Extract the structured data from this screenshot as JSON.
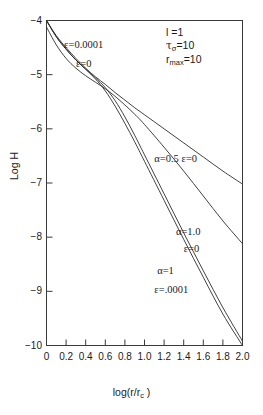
{
  "chart_data": {
    "type": "line",
    "title": "",
    "xlabel": "log(r/r_c )",
    "ylabel": "Log H",
    "xlim": [
      0,
      2.0
    ],
    "ylim": [
      -10,
      -4
    ],
    "grid": false,
    "legend": "inline-annotations",
    "xticks": [
      "0",
      "0.2",
      "0.4",
      "0.6",
      "0.8",
      "1.0",
      "1.2",
      "1.4",
      "1.6",
      "1.8",
      "2.0"
    ],
    "xtick_values": [
      0,
      0.2,
      0.4,
      0.6,
      0.8,
      1.0,
      1.2,
      1.4,
      1.6,
      1.8,
      2.0
    ],
    "yticks": [
      "-4",
      "-5",
      "-6",
      "-7",
      "-8",
      "-9",
      "-10"
    ],
    "ytick_values": [
      -4,
      -5,
      -6,
      -7,
      -8,
      -9,
      -10
    ],
    "series": [
      {
        "name": "alpha=0.5 epsilon=0.0001",
        "label": "ε=0.0001",
        "x": [
          0.0,
          0.1,
          0.2,
          0.3,
          0.4,
          0.5,
          0.6,
          0.7,
          0.8,
          0.9,
          1.0,
          1.2,
          1.4,
          1.6,
          1.8,
          2.0
        ],
        "y": [
          -4.0,
          -4.28,
          -4.5,
          -4.7,
          -4.88,
          -5.04,
          -5.18,
          -5.33,
          -5.47,
          -5.61,
          -5.74,
          -6.0,
          -6.26,
          -6.52,
          -6.78,
          -7.02
        ]
      },
      {
        "name": "alpha=0.5 epsilon=0",
        "label": "ε=0",
        "x": [
          0.0,
          0.1,
          0.2,
          0.3,
          0.4,
          0.5,
          0.6,
          0.7,
          0.8,
          0.9,
          1.0,
          1.2,
          1.4,
          1.6,
          1.8,
          2.0
        ],
        "y": [
          -4.12,
          -4.45,
          -4.7,
          -4.88,
          -5.02,
          -5.14,
          -5.26,
          -5.4,
          -5.56,
          -5.73,
          -5.92,
          -6.34,
          -6.78,
          -7.24,
          -7.7,
          -8.12
        ]
      },
      {
        "name": "alpha=1.0 epsilon=0",
        "label": "α=1.0 ε=0",
        "x": [
          0.0,
          0.1,
          0.2,
          0.3,
          0.4,
          0.5,
          0.6,
          0.7,
          0.8,
          0.9,
          1.0,
          1.2,
          1.4,
          1.6,
          1.8,
          2.0
        ],
        "y": [
          -4.0,
          -4.3,
          -4.53,
          -4.73,
          -4.9,
          -5.06,
          -5.24,
          -5.48,
          -5.78,
          -6.12,
          -6.48,
          -7.2,
          -7.92,
          -8.62,
          -9.3,
          -9.92
        ]
      },
      {
        "name": "alpha=1 epsilon=.0001",
        "label": "α=1 ε=.0001",
        "x": [
          0.0,
          0.1,
          0.2,
          0.3,
          0.4,
          0.5,
          0.6,
          0.7,
          0.8,
          0.9,
          1.0,
          1.2,
          1.4,
          1.6,
          1.8,
          2.0
        ],
        "y": [
          -4.0,
          -4.3,
          -4.53,
          -4.73,
          -4.9,
          -5.08,
          -5.3,
          -5.58,
          -5.9,
          -6.24,
          -6.6,
          -7.32,
          -8.04,
          -8.74,
          -9.42,
          -10.0
        ]
      }
    ],
    "annotations": [
      {
        "id": "eps-0001",
        "text": "ε=0.0001",
        "x": 0.18,
        "y": -4.45
      },
      {
        "id": "eps-0",
        "text": "ε=0",
        "x": 0.3,
        "y": -4.8
      },
      {
        "id": "alpha-05-eps-0",
        "text": "α=0.5 ε=0",
        "x": 1.1,
        "y": -6.55
      },
      {
        "id": "alpha-10",
        "text": "α=1.0",
        "x": 1.32,
        "y": -7.9
      },
      {
        "id": "alpha-10-eps-0",
        "text": "ε=0",
        "x": 1.4,
        "y": -8.22
      },
      {
        "id": "alpha-1",
        "text": "α=1",
        "x": 1.13,
        "y": -8.62
      },
      {
        "id": "alpha-1-eps-0001",
        "text": "ε=.0001",
        "x": 1.1,
        "y": -8.98
      }
    ],
    "parameters": {
      "l": "l =1",
      "tau": "τ",
      "tau_sub": "σ",
      "tau_val": "=10",
      "rmax": "r",
      "rmax_sub": "max",
      "rmax_val": "=10"
    }
  }
}
